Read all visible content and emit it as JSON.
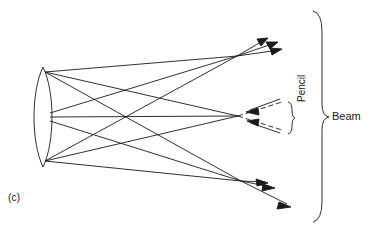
{
  "figure": {
    "panel_label": "(c)",
    "caption_labels": {
      "pencil": "Pencil",
      "beam": "Beam"
    },
    "stroke_color": "#1a1a1a",
    "background_color": "#ffffff",
    "stroke_width": 0.9
  },
  "diagram": {
    "type": "optical-ray-diagram",
    "viewbox": [
      0,
      0,
      372,
      232
    ],
    "lens": {
      "name": "biconvex-lens",
      "top_vertex": [
        43,
        67
      ],
      "bottom_vertex": [
        43,
        167
      ],
      "left_bulge_x": 32,
      "right_bulge_x": 54,
      "aperture_points": [
        {
          "id": "top",
          "x": 45,
          "y": 72
        },
        {
          "id": "middle",
          "x": 50,
          "y": 117
        },
        {
          "id": "bottom",
          "x": 45,
          "y": 161
        }
      ]
    },
    "foci": [
      {
        "id": "upper",
        "x": 237,
        "y": 56
      },
      {
        "id": "central",
        "x": 238,
        "y": 116
      },
      {
        "id": "lower",
        "x": 241,
        "y": 181
      }
    ],
    "rays": [
      {
        "from": "top",
        "to": "upper"
      },
      {
        "from": "top",
        "to": "central"
      },
      {
        "from": "top",
        "to": "lower"
      },
      {
        "from": "middle",
        "to": "upper"
      },
      {
        "from": "middle",
        "to": "central"
      },
      {
        "from": "middle",
        "to": "lower"
      },
      {
        "from": "bottom",
        "to": "upper"
      },
      {
        "from": "bottom",
        "to": "central"
      },
      {
        "from": "bottom",
        "to": "lower"
      }
    ],
    "pencils": [
      {
        "id": "upper-pencil",
        "focus": [
          237,
          56
        ],
        "arrow_direction": "up-right",
        "arrow_tips": [
          [
            268,
            38
          ],
          [
            277,
            42
          ],
          [
            281,
            49
          ]
        ]
      },
      {
        "id": "central-pencil",
        "focus": [
          238,
          116
        ],
        "arrow_direction": "converging-left",
        "arrow_tips": [
          [
            248,
            112
          ],
          [
            249,
            120
          ]
        ],
        "dashed_extensions": [
          [
            [
              248,
              107
            ],
            [
              280,
              99
            ]
          ],
          [
            [
              249,
              125
            ],
            [
              280,
              132
            ]
          ]
        ]
      },
      {
        "id": "lower-pencil",
        "focus": [
          241,
          181
        ],
        "arrow_direction": "down-right",
        "arrow_tips": [
          [
            267,
            182
          ],
          [
            273,
            188
          ],
          [
            289,
            206
          ]
        ]
      }
    ],
    "brackets": [
      {
        "id": "pencil-bracket",
        "label": "Pencil",
        "x": 290,
        "y_top": 102,
        "y_bottom": 134,
        "orientation": "right-facing"
      },
      {
        "id": "beam-bracket",
        "label": "Beam",
        "x": 322,
        "y_top": 11,
        "y_bottom": 222,
        "orientation": "right-facing"
      }
    ]
  }
}
